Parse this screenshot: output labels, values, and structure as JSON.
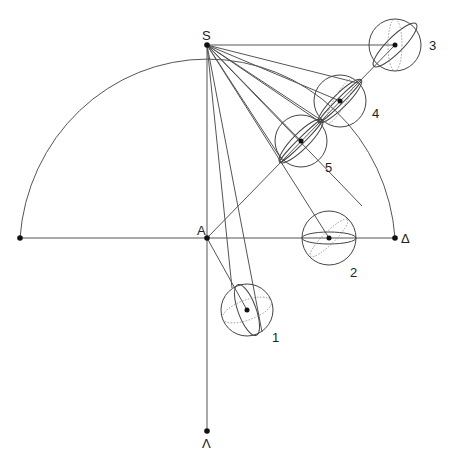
{
  "diagram": {
    "title": "",
    "points": {
      "S": {
        "label": "S",
        "x": 207,
        "y": 45
      },
      "A": {
        "label": "A",
        "x": 207,
        "y": 238
      },
      "Delta": {
        "label": "Δ",
        "x": 395,
        "y": 238
      },
      "Lambda": {
        "label": "Λ",
        "x": 207,
        "y": 431
      },
      "West": {
        "label": "",
        "x": 20,
        "y": 238
      }
    },
    "spheres": [
      {
        "id": 1,
        "label": "1",
        "cx": 247,
        "cy": 310,
        "r": 26
      },
      {
        "id": 2,
        "label": "2",
        "cx": 329,
        "cy": 238,
        "r": 27
      },
      {
        "id": 3,
        "label": "3",
        "cx": 395,
        "cy": 45,
        "r": 26
      },
      {
        "id": 4,
        "label": "4",
        "cx": 340,
        "cy": 101,
        "r": 26
      },
      {
        "id": 5,
        "label": "5",
        "cx": 301,
        "cy": 141,
        "r": 26
      }
    ],
    "arc": {
      "cx": 207,
      "cy": 238,
      "r": 190,
      "description": "semicircle from west point through S to Δ"
    },
    "colors": {
      "line": "#555555",
      "point": "#111111",
      "label": "#222222"
    }
  }
}
